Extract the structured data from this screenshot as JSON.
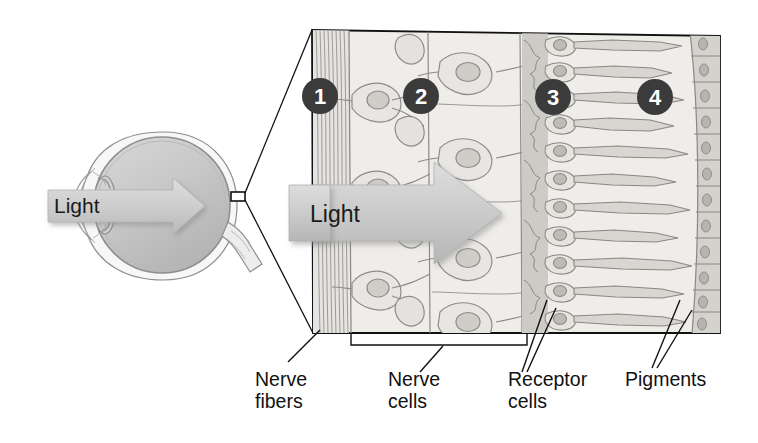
{
  "figure": {
    "background_color": "#ffffff",
    "panel": {
      "border_color": "#111111",
      "fill_color": "#efedea"
    },
    "callout_box_color": "#111111",
    "marker_fill_color": "#3b3b3b",
    "marker_text_color": "#ffffff",
    "arrow_fill_color": "#c9c9c9",
    "eye_fill_color": "#c4c4c4"
  },
  "eye": {
    "light_arrow_label": "Light",
    "name": "eyeball-cross-section"
  },
  "retina_panel": {
    "light_arrow_label": "Light",
    "markers": [
      {
        "number": "1",
        "cx": 320,
        "cy": 96
      },
      {
        "number": "2",
        "cx": 421,
        "cy": 96
      },
      {
        "number": "3",
        "cx": 553,
        "cy": 97
      },
      {
        "number": "4",
        "cx": 655,
        "cy": 97
      }
    ]
  },
  "labels": [
    {
      "id": "nerve-fibers",
      "line1": "Nerve",
      "line2": "fibers",
      "x": 255,
      "y": 386
    },
    {
      "id": "nerve-cells",
      "line1": "Nerve",
      "line2": "cells",
      "x": 388,
      "y": 386
    },
    {
      "id": "receptor-cells",
      "line1": "Receptor",
      "line2": "cells",
      "x": 508,
      "y": 386
    },
    {
      "id": "pigments",
      "line1": "Pigments",
      "line2": "",
      "x": 625,
      "y": 386
    }
  ]
}
